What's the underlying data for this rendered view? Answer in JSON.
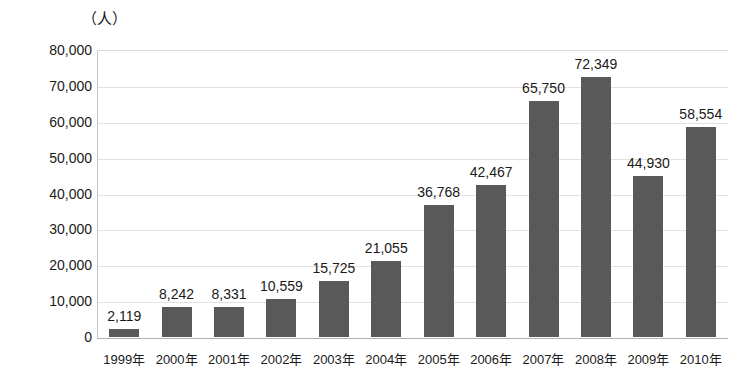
{
  "chart_data": {
    "type": "bar",
    "title": "",
    "subtitle": "",
    "xlabel": "",
    "ylabel": "（人）",
    "unit_caption": "（人）",
    "categories": [
      "1999年",
      "2000年",
      "2001年",
      "2002年",
      "2003年",
      "2004年",
      "2005年",
      "2006年",
      "2007年",
      "2008年",
      "2009年",
      "2010年"
    ],
    "values": [
      2119,
      8242,
      8331,
      10559,
      15725,
      21055,
      36768,
      42467,
      65750,
      72349,
      44930,
      58554
    ],
    "value_labels": [
      "2,119",
      "8,242",
      "8,331",
      "10,559",
      "15,725",
      "21,055",
      "36,768",
      "42,467",
      "65,750",
      "72,349",
      "44,930",
      "58,554"
    ],
    "ylim": [
      0,
      80000
    ],
    "ytick_values": [
      80000,
      70000,
      60000,
      50000,
      40000,
      30000,
      20000,
      10000,
      0
    ],
    "ytick_labels": [
      "80,000",
      "70,000",
      "60,000",
      "50,000",
      "40,000",
      "30,000",
      "20,000",
      "10,000",
      "0"
    ],
    "grid": true,
    "grid_axis": "y",
    "legend": false,
    "legend_position": "none",
    "bar_color": "#595959",
    "gridline_color": "#e2e2e2",
    "axis_color": "#b0b0b0",
    "text_color": "#1a1a1a",
    "background_color": "#ffffff"
  }
}
